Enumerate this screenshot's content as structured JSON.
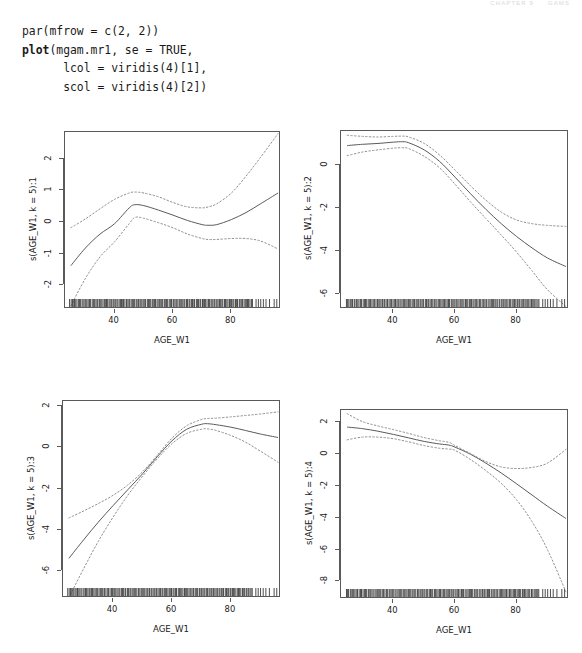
{
  "running_header": {
    "left": "CHAPTER 9",
    "right": "GAMS"
  },
  "code": {
    "lines": [
      {
        "segments": [
          {
            "text": "par(mfrow = c(2, 2))",
            "bold": false
          }
        ]
      },
      {
        "segments": [
          {
            "text": "plot",
            "bold": true
          },
          {
            "text": "(mgam.mr1, se = TRUE,",
            "bold": false
          }
        ]
      },
      {
        "segments": [
          {
            "text": "      lcol = viridis(4)[1],",
            "bold": false
          }
        ]
      },
      {
        "segments": [
          {
            "text": "      scol = viridis(4)[2])",
            "bold": false
          }
        ]
      }
    ]
  },
  "colors": {
    "line": "#5a5a5a",
    "band": "#8f8f8f",
    "axis": "#5a5a5a",
    "text": "#1a1a1a",
    "background": "#ffffff"
  },
  "chart_data": [
    {
      "type": "line",
      "panel": 1,
      "title": "",
      "xlabel": "AGE_W1",
      "ylabel": "s(AGE_W1, k = 5):1",
      "xlim": [
        23,
        97
      ],
      "ylim": [
        -2.75,
        2.85
      ],
      "xticks": [
        40,
        60,
        80
      ],
      "yticks": [
        2,
        1,
        0,
        -1,
        -2
      ],
      "grid": false,
      "legend": "none",
      "series": [
        {
          "name": "fit",
          "style": "solid",
          "x": [
            25,
            30,
            35,
            40,
            45,
            47,
            50,
            55,
            60,
            65,
            70,
            72,
            75,
            80,
            85,
            90,
            96
          ],
          "values": [
            -1.38,
            -0.82,
            -0.38,
            -0.05,
            0.45,
            0.55,
            0.52,
            0.38,
            0.22,
            0.05,
            -0.08,
            -0.1,
            -0.08,
            0.08,
            0.3,
            0.58,
            0.92
          ]
        },
        {
          "name": "upper",
          "style": "dotted",
          "x": [
            25,
            30,
            35,
            40,
            45,
            47,
            50,
            55,
            60,
            65,
            70,
            72,
            75,
            80,
            85,
            90,
            96
          ],
          "values": [
            -0.18,
            0.1,
            0.42,
            0.72,
            0.92,
            0.95,
            0.92,
            0.8,
            0.62,
            0.48,
            0.45,
            0.48,
            0.58,
            0.92,
            1.45,
            2.05,
            2.8
          ]
        },
        {
          "name": "lower",
          "style": "dotted",
          "x": [
            25,
            30,
            35,
            40,
            45,
            47,
            50,
            55,
            60,
            65,
            70,
            72,
            75,
            80,
            85,
            90,
            96
          ],
          "values": [
            -2.65,
            -1.78,
            -1.1,
            -0.62,
            -0.05,
            0.15,
            0.12,
            -0.02,
            -0.18,
            -0.38,
            -0.52,
            -0.55,
            -0.55,
            -0.52,
            -0.52,
            -0.6,
            -0.85
          ]
        }
      ],
      "rug": true
    },
    {
      "type": "line",
      "panel": 2,
      "title": "",
      "xlabel": "AGE_W1",
      "ylabel": "s(AGE_W1, k = 5):2",
      "xlim": [
        23,
        97
      ],
      "ylim": [
        -6.7,
        1.6
      ],
      "xticks": [
        40,
        60,
        80
      ],
      "yticks": [
        0,
        -2,
        -4,
        -6
      ],
      "grid": false,
      "legend": "none",
      "series": [
        {
          "name": "fit",
          "style": "solid",
          "x": [
            25,
            30,
            35,
            40,
            43,
            45,
            50,
            55,
            60,
            65,
            70,
            75,
            80,
            85,
            90,
            96
          ],
          "values": [
            0.92,
            0.98,
            1.02,
            1.08,
            1.1,
            1.05,
            0.72,
            0.18,
            -0.55,
            -1.32,
            -2.05,
            -2.72,
            -3.32,
            -3.85,
            -4.32,
            -4.72
          ]
        },
        {
          "name": "upper",
          "style": "dotted",
          "x": [
            25,
            30,
            35,
            40,
            43,
            45,
            50,
            55,
            60,
            65,
            70,
            75,
            80,
            85,
            90,
            96
          ],
          "values": [
            1.4,
            1.35,
            1.32,
            1.35,
            1.36,
            1.32,
            1.02,
            0.48,
            -0.22,
            -0.95,
            -1.62,
            -2.18,
            -2.55,
            -2.72,
            -2.8,
            -2.85
          ]
        },
        {
          "name": "lower",
          "style": "dotted",
          "x": [
            25,
            30,
            35,
            40,
            43,
            45,
            50,
            55,
            60,
            65,
            70,
            75,
            80,
            85,
            90,
            96
          ],
          "values": [
            0.45,
            0.62,
            0.72,
            0.8,
            0.82,
            0.78,
            0.42,
            -0.12,
            -0.88,
            -1.7,
            -2.48,
            -3.25,
            -4.05,
            -4.92,
            -5.8,
            -6.58
          ]
        }
      ],
      "rug": true
    },
    {
      "type": "line",
      "panel": 3,
      "title": "",
      "xlabel": "AGE_W1",
      "ylabel": "s(AGE_W1, k = 5):3",
      "xlim": [
        23,
        97
      ],
      "ylim": [
        -7.3,
        2.25
      ],
      "xticks": [
        40,
        60,
        80
      ],
      "yticks": [
        2,
        0,
        -2,
        -4,
        -6
      ],
      "grid": false,
      "legend": "none",
      "series": [
        {
          "name": "fit",
          "style": "solid",
          "x": [
            25,
            30,
            35,
            40,
            45,
            50,
            55,
            60,
            65,
            70,
            72,
            75,
            80,
            85,
            90,
            96
          ],
          "values": [
            -5.38,
            -4.48,
            -3.62,
            -2.82,
            -2.05,
            -1.28,
            -0.45,
            0.32,
            0.88,
            1.12,
            1.15,
            1.1,
            0.98,
            0.82,
            0.65,
            0.48
          ]
        },
        {
          "name": "upper",
          "style": "dotted",
          "x": [
            25,
            30,
            35,
            40,
            45,
            50,
            55,
            60,
            65,
            70,
            72,
            75,
            80,
            85,
            90,
            96
          ],
          "values": [
            -3.42,
            -3.08,
            -2.72,
            -2.32,
            -1.82,
            -1.18,
            -0.38,
            0.45,
            1.05,
            1.35,
            1.4,
            1.42,
            1.48,
            1.55,
            1.62,
            1.72
          ]
        },
        {
          "name": "lower",
          "style": "dotted",
          "x": [
            25,
            30,
            35,
            40,
            45,
            50,
            55,
            60,
            65,
            70,
            72,
            75,
            80,
            85,
            90,
            96
          ],
          "values": [
            -7.28,
            -5.88,
            -4.55,
            -3.38,
            -2.32,
            -1.4,
            -0.55,
            0.18,
            0.68,
            0.88,
            0.9,
            0.82,
            0.58,
            0.25,
            -0.18,
            -0.72
          ]
        }
      ],
      "rug": true
    },
    {
      "type": "line",
      "panel": 4,
      "title": "",
      "xlabel": "AGE_W1",
      "ylabel": "s(AGE_W1, k = 5):4",
      "xlim": [
        23,
        97
      ],
      "ylim": [
        -9.1,
        2.75
      ],
      "xticks": [
        40,
        60,
        80
      ],
      "yticks": [
        2,
        0,
        -2,
        -4,
        -6,
        -8
      ],
      "grid": false,
      "legend": "none",
      "series": [
        {
          "name": "fit",
          "style": "solid",
          "x": [
            25,
            30,
            35,
            40,
            45,
            50,
            55,
            58,
            60,
            65,
            70,
            75,
            80,
            85,
            90,
            96
          ],
          "values": [
            1.68,
            1.58,
            1.42,
            1.22,
            1.0,
            0.78,
            0.62,
            0.55,
            0.42,
            -0.02,
            -0.58,
            -1.2,
            -1.88,
            -2.58,
            -3.28,
            -4.05
          ]
        },
        {
          "name": "upper",
          "style": "dotted",
          "x": [
            25,
            30,
            35,
            40,
            45,
            50,
            55,
            58,
            60,
            65,
            70,
            75,
            80,
            85,
            90,
            96
          ],
          "values": [
            2.52,
            2.02,
            1.75,
            1.52,
            1.28,
            1.02,
            0.82,
            0.72,
            0.52,
            0.02,
            -0.48,
            -0.82,
            -0.92,
            -0.85,
            -0.58,
            0.28
          ]
        },
        {
          "name": "lower",
          "style": "dotted",
          "x": [
            25,
            30,
            35,
            40,
            45,
            50,
            55,
            58,
            60,
            65,
            70,
            75,
            80,
            85,
            90,
            96
          ],
          "values": [
            0.88,
            1.05,
            1.05,
            0.95,
            0.75,
            0.52,
            0.35,
            0.3,
            0.22,
            -0.35,
            -1.05,
            -1.85,
            -2.88,
            -4.25,
            -6.0,
            -8.65
          ]
        }
      ],
      "rug": true
    }
  ]
}
